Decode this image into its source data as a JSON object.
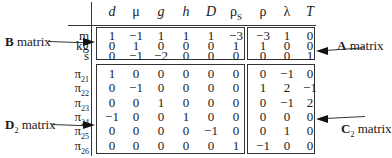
{
  "columns": [
    {
      "label": "d",
      "italic": true,
      "sub": ""
    },
    {
      "label": "μ",
      "italic": false,
      "sub": ""
    },
    {
      "label": "g",
      "italic": true,
      "sub": ""
    },
    {
      "label": "h",
      "italic": true,
      "sub": ""
    },
    {
      "label": "D",
      "italic": true,
      "sub": ""
    },
    {
      "label": "ρ",
      "italic": false,
      "sub": "S"
    },
    {
      "label": "ρ",
      "italic": false,
      "sub": ""
    },
    {
      "label": "λ",
      "italic": false,
      "sub": ""
    },
    {
      "label": "T",
      "italic": true,
      "sub": ""
    }
  ],
  "dimension_rows": [
    {
      "label": "m",
      "values": [
        "1",
        "−1",
        "1",
        "1",
        "1",
        "−3",
        "−3",
        "1",
        "0"
      ]
    },
    {
      "label": "kg",
      "values": [
        "0",
        "1",
        "0",
        "0",
        "0",
        "1",
        "1",
        "0",
        "0"
      ]
    },
    {
      "label": "s",
      "values": [
        "0",
        "−1",
        "−2",
        "0",
        "0",
        "0",
        "0",
        "0",
        "1"
      ]
    }
  ],
  "pi_rows": [
    {
      "label": "π",
      "sub": "21",
      "values": [
        "1",
        "0",
        "0",
        "0",
        "0",
        "0",
        "0",
        "−1",
        "0"
      ]
    },
    {
      "label": "π",
      "sub": "22",
      "values": [
        "0",
        "−1",
        "0",
        "0",
        "0",
        "0",
        "1",
        "2",
        "−1"
      ]
    },
    {
      "label": "π",
      "sub": "23",
      "values": [
        "0",
        "0",
        "1",
        "0",
        "0",
        "0",
        "0",
        "−1",
        "2"
      ]
    },
    {
      "label": "π",
      "sub": "24",
      "values": [
        "−1",
        "0",
        "0",
        "1",
        "0",
        "0",
        "0",
        "0",
        "0"
      ]
    },
    {
      "label": "π",
      "sub": "25",
      "values": [
        "0",
        "0",
        "0",
        "0",
        "−1",
        "0",
        "0",
        "1",
        "0"
      ]
    },
    {
      "label": "π",
      "sub": "26",
      "values": [
        "0",
        "0",
        "0",
        "0",
        "0",
        "1",
        "−1",
        "0",
        "0"
      ]
    }
  ],
  "callouts": {
    "b": {
      "bold": "B",
      "sub": "",
      "text": " matrix"
    },
    "a": {
      "bold": "A",
      "sub": "",
      "text": " matrix"
    },
    "d2": {
      "bold": "D",
      "sub": "2",
      "text": " matrix"
    },
    "c2": {
      "bold": "C",
      "sub": "2",
      "text": " matrix"
    }
  }
}
